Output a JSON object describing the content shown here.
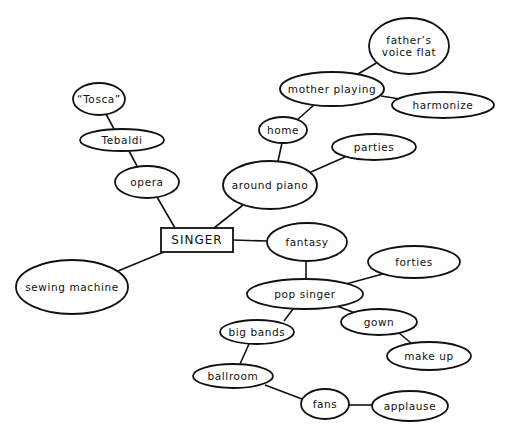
{
  "diagram": {
    "type": "mind-map",
    "center": {
      "id": "singer",
      "label": "SINGER",
      "shape": "rect",
      "x": 161,
      "y": 228,
      "w": 72,
      "h": 24
    },
    "nodes": [
      {
        "id": "tosca",
        "lines": [
          "“Tosca”"
        ],
        "cx": 99,
        "cy": 99,
        "rx": 26,
        "ry": 16
      },
      {
        "id": "tebaldi",
        "lines": [
          "Tebaldi"
        ],
        "cx": 122,
        "cy": 140,
        "rx": 42,
        "ry": 11
      },
      {
        "id": "opera",
        "lines": [
          "opera"
        ],
        "cx": 147,
        "cy": 182,
        "rx": 32,
        "ry": 16
      },
      {
        "id": "sewing-machine",
        "lines": [
          "sewing machine"
        ],
        "cx": 72,
        "cy": 287,
        "rx": 56,
        "ry": 27
      },
      {
        "id": "around-piano",
        "lines": [
          "around piano"
        ],
        "cx": 270,
        "cy": 185,
        "rx": 47,
        "ry": 24
      },
      {
        "id": "home",
        "lines": [
          "home"
        ],
        "cx": 283,
        "cy": 130,
        "rx": 24,
        "ry": 13
      },
      {
        "id": "mother-playing",
        "lines": [
          "mother playing"
        ],
        "cx": 332,
        "cy": 89,
        "rx": 52,
        "ry": 17
      },
      {
        "id": "fathers-voice-flat",
        "lines": [
          "father’s",
          "voice flat"
        ],
        "cx": 409,
        "cy": 46,
        "rx": 40,
        "ry": 28
      },
      {
        "id": "harmonize",
        "lines": [
          "harmonize"
        ],
        "cx": 443,
        "cy": 105,
        "rx": 51,
        "ry": 13
      },
      {
        "id": "parties",
        "lines": [
          "parties"
        ],
        "cx": 374,
        "cy": 147,
        "rx": 42,
        "ry": 13
      },
      {
        "id": "fantasy",
        "lines": [
          "fantasy"
        ],
        "cx": 307,
        "cy": 242,
        "rx": 40,
        "ry": 19
      },
      {
        "id": "pop-singer",
        "lines": [
          "pop singer"
        ],
        "cx": 305,
        "cy": 294,
        "rx": 58,
        "ry": 15
      },
      {
        "id": "forties",
        "lines": [
          "forties"
        ],
        "cx": 414,
        "cy": 262,
        "rx": 46,
        "ry": 16
      },
      {
        "id": "big-bands",
        "lines": [
          "big bands"
        ],
        "cx": 257,
        "cy": 332,
        "rx": 37,
        "ry": 12
      },
      {
        "id": "gown",
        "lines": [
          "gown"
        ],
        "cx": 379,
        "cy": 322,
        "rx": 38,
        "ry": 13
      },
      {
        "id": "make-up",
        "lines": [
          "make up"
        ],
        "cx": 429,
        "cy": 356,
        "rx": 42,
        "ry": 14
      },
      {
        "id": "ballroom",
        "lines": [
          "ballroom"
        ],
        "cx": 233,
        "cy": 376,
        "rx": 40,
        "ry": 12
      },
      {
        "id": "fans",
        "lines": [
          "fans"
        ],
        "cx": 325,
        "cy": 404,
        "rx": 24,
        "ry": 15
      },
      {
        "id": "applause",
        "lines": [
          "applause"
        ],
        "cx": 410,
        "cy": 406,
        "rx": 38,
        "ry": 15
      }
    ],
    "edges": [
      {
        "from": "tosca",
        "to": "tebaldi",
        "x1": 106,
        "y1": 114,
        "x2": 114,
        "y2": 129
      },
      {
        "from": "tebaldi",
        "to": "opera",
        "x1": 129,
        "y1": 151,
        "x2": 137,
        "y2": 166
      },
      {
        "from": "opera",
        "to": "singer",
        "x1": 157,
        "y1": 197,
        "x2": 175,
        "y2": 228
      },
      {
        "from": "singer",
        "to": "sewing-machine",
        "x1": 164,
        "y1": 252,
        "x2": 118,
        "y2": 271
      },
      {
        "from": "singer",
        "to": "around-piano",
        "x1": 214,
        "y1": 228,
        "x2": 243,
        "y2": 205
      },
      {
        "from": "around-piano",
        "to": "home",
        "x1": 278,
        "y1": 161,
        "x2": 282,
        "y2": 143
      },
      {
        "from": "home",
        "to": "mother-playing",
        "x1": 297,
        "y1": 120,
        "x2": 314,
        "y2": 105
      },
      {
        "from": "mother-playing",
        "to": "fathers-voice-flat",
        "x1": 358,
        "y1": 74,
        "x2": 378,
        "y2": 62
      },
      {
        "from": "mother-playing",
        "to": "harmonize",
        "x1": 381,
        "y1": 96,
        "x2": 400,
        "y2": 99
      },
      {
        "from": "around-piano",
        "to": "parties",
        "x1": 311,
        "y1": 172,
        "x2": 345,
        "y2": 157
      },
      {
        "from": "singer",
        "to": "fantasy",
        "x1": 233,
        "y1": 240,
        "x2": 267,
        "y2": 241
      },
      {
        "from": "fantasy",
        "to": "pop-singer",
        "x1": 306,
        "y1": 261,
        "x2": 306,
        "y2": 279
      },
      {
        "from": "pop-singer",
        "to": "forties",
        "x1": 346,
        "y1": 284,
        "x2": 390,
        "y2": 272
      },
      {
        "from": "pop-singer",
        "to": "big-bands",
        "x1": 293,
        "y1": 309,
        "x2": 284,
        "y2": 321
      },
      {
        "from": "pop-singer",
        "to": "gown",
        "x1": 337,
        "y1": 306,
        "x2": 355,
        "y2": 313
      },
      {
        "from": "gown",
        "to": "make-up",
        "x1": 399,
        "y1": 333,
        "x2": 411,
        "y2": 343
      },
      {
        "from": "big-bands",
        "to": "ballroom",
        "x1": 249,
        "y1": 344,
        "x2": 240,
        "y2": 364
      },
      {
        "from": "ballroom",
        "to": "fans",
        "x1": 265,
        "y1": 385,
        "x2": 302,
        "y2": 399
      },
      {
        "from": "fans",
        "to": "applause",
        "x1": 349,
        "y1": 405,
        "x2": 372,
        "y2": 405
      }
    ]
  }
}
